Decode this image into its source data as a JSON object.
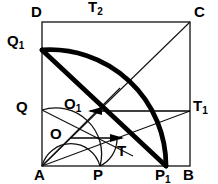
{
  "figure": {
    "type": "geometry-diagram",
    "canvas": {
      "width": 218,
      "height": 184
    },
    "colors": {
      "background": "#ffffff",
      "stroke": "#000000",
      "thick_arc": "#000000",
      "thin_line": "#1a1a1a"
    },
    "square": {
      "name": "ABCD",
      "left": 42,
      "top": 22,
      "right": 190,
      "bottom": 166,
      "stroke_width": 1.2
    },
    "points": {
      "A": {
        "x": 42,
        "y": 166
      },
      "B": {
        "x": 190,
        "y": 166
      },
      "C": {
        "x": 190,
        "y": 22
      },
      "D": {
        "x": 42,
        "y": 22
      },
      "P": {
        "x": 100,
        "y": 166
      },
      "P1": {
        "x": 166,
        "y": 166
      },
      "Q": {
        "x": 42,
        "y": 110
      },
      "Q1": {
        "x": 42,
        "y": 50
      },
      "O": {
        "x": 71,
        "y": 138
      },
      "O1": {
        "x": 85,
        "y": 111
      },
      "T": {
        "x": 115,
        "y": 142
      },
      "T1": {
        "x": 190,
        "y": 111
      },
      "T2": {
        "x": 101,
        "y": 22
      }
    },
    "arcs": {
      "major": {
        "center": "A",
        "radius": 148,
        "from": "Q1",
        "through": "T2",
        "to": "P1",
        "stroke_width": 4.6
      },
      "mid": {
        "center": "O1",
        "radius": 45,
        "from": "Q",
        "through": "T2region",
        "to": "P",
        "stroke_width": 1.2
      },
      "small": {
        "center": "O",
        "radius": 29,
        "from": "O",
        "to": "T",
        "stroke_width": 1.2
      }
    },
    "labels": [
      {
        "id": "label-D",
        "base": "D",
        "sub": "",
        "x": 31,
        "y": 6,
        "name": "vertex-label-D"
      },
      {
        "id": "label-T2",
        "base": "T",
        "sub": "2",
        "x": 88,
        "y": 0,
        "name": "vertex-label-t2"
      },
      {
        "id": "label-C",
        "base": "C",
        "sub": "",
        "x": 194,
        "y": 6,
        "name": "vertex-label-C"
      },
      {
        "id": "label-Q1",
        "base": "Q",
        "sub": "1",
        "x": 7,
        "y": 33,
        "name": "vertex-label-q1"
      },
      {
        "id": "label-Q",
        "base": "Q",
        "sub": "",
        "x": 16,
        "y": 99,
        "name": "vertex-label-Q"
      },
      {
        "id": "label-O1",
        "base": "O",
        "sub": "1",
        "x": 64,
        "y": 96,
        "name": "vertex-label-o1"
      },
      {
        "id": "label-T1",
        "base": "T",
        "sub": "1",
        "x": 193,
        "y": 98,
        "name": "vertex-label-t1"
      },
      {
        "id": "label-O",
        "base": "O",
        "sub": "",
        "x": 50,
        "y": 126,
        "name": "vertex-label-O"
      },
      {
        "id": "label-T",
        "base": "T",
        "sub": "",
        "x": 117,
        "y": 144,
        "name": "vertex-label-T"
      },
      {
        "id": "label-A",
        "base": "A",
        "sub": "",
        "x": 34,
        "y": 167,
        "name": "vertex-label-A"
      },
      {
        "id": "label-P",
        "base": "P",
        "sub": "",
        "x": 93,
        "y": 167,
        "name": "vertex-label-P"
      },
      {
        "id": "label-P1",
        "base": "P",
        "sub": "1",
        "x": 155,
        "y": 167,
        "name": "vertex-label-p1"
      },
      {
        "id": "label-B",
        "base": "B",
        "sub": "",
        "x": 183,
        "y": 167,
        "name": "vertex-label-B"
      }
    ],
    "arrows": [
      {
        "id": "arrow-upper",
        "from_x": 190,
        "from_y": 111,
        "to_x": 86,
        "to_y": 111,
        "direction": "left",
        "name": "radius-arrow-o1-t1"
      },
      {
        "id": "arrow-lower",
        "from_x": 71,
        "from_y": 138,
        "to_x": 124,
        "to_y": 138,
        "direction": "right",
        "name": "radius-arrow-o-t"
      }
    ],
    "thin_lines": [
      {
        "id": "line-A-C",
        "x1": 42,
        "y1": 166,
        "x2": 190,
        "y2": 22,
        "name": "diagonal-a-c"
      },
      {
        "id": "line-A-T1",
        "x1": 42,
        "y1": 166,
        "x2": 190,
        "y2": 111,
        "name": "segment-a-t1"
      },
      {
        "id": "line-A-O1",
        "x1": 42,
        "y1": 166,
        "x2": 115,
        "y2": 93,
        "name": "segment-a-o1"
      },
      {
        "id": "line-Q-O1",
        "x1": 42,
        "y1": 110,
        "x2": 129,
        "y2": 153,
        "name": "segment-q-t"
      },
      {
        "id": "line-A-Q1",
        "x1": 42,
        "y1": 166,
        "x2": 42,
        "y2": 50,
        "name": "segment-a-q1"
      }
    ]
  }
}
